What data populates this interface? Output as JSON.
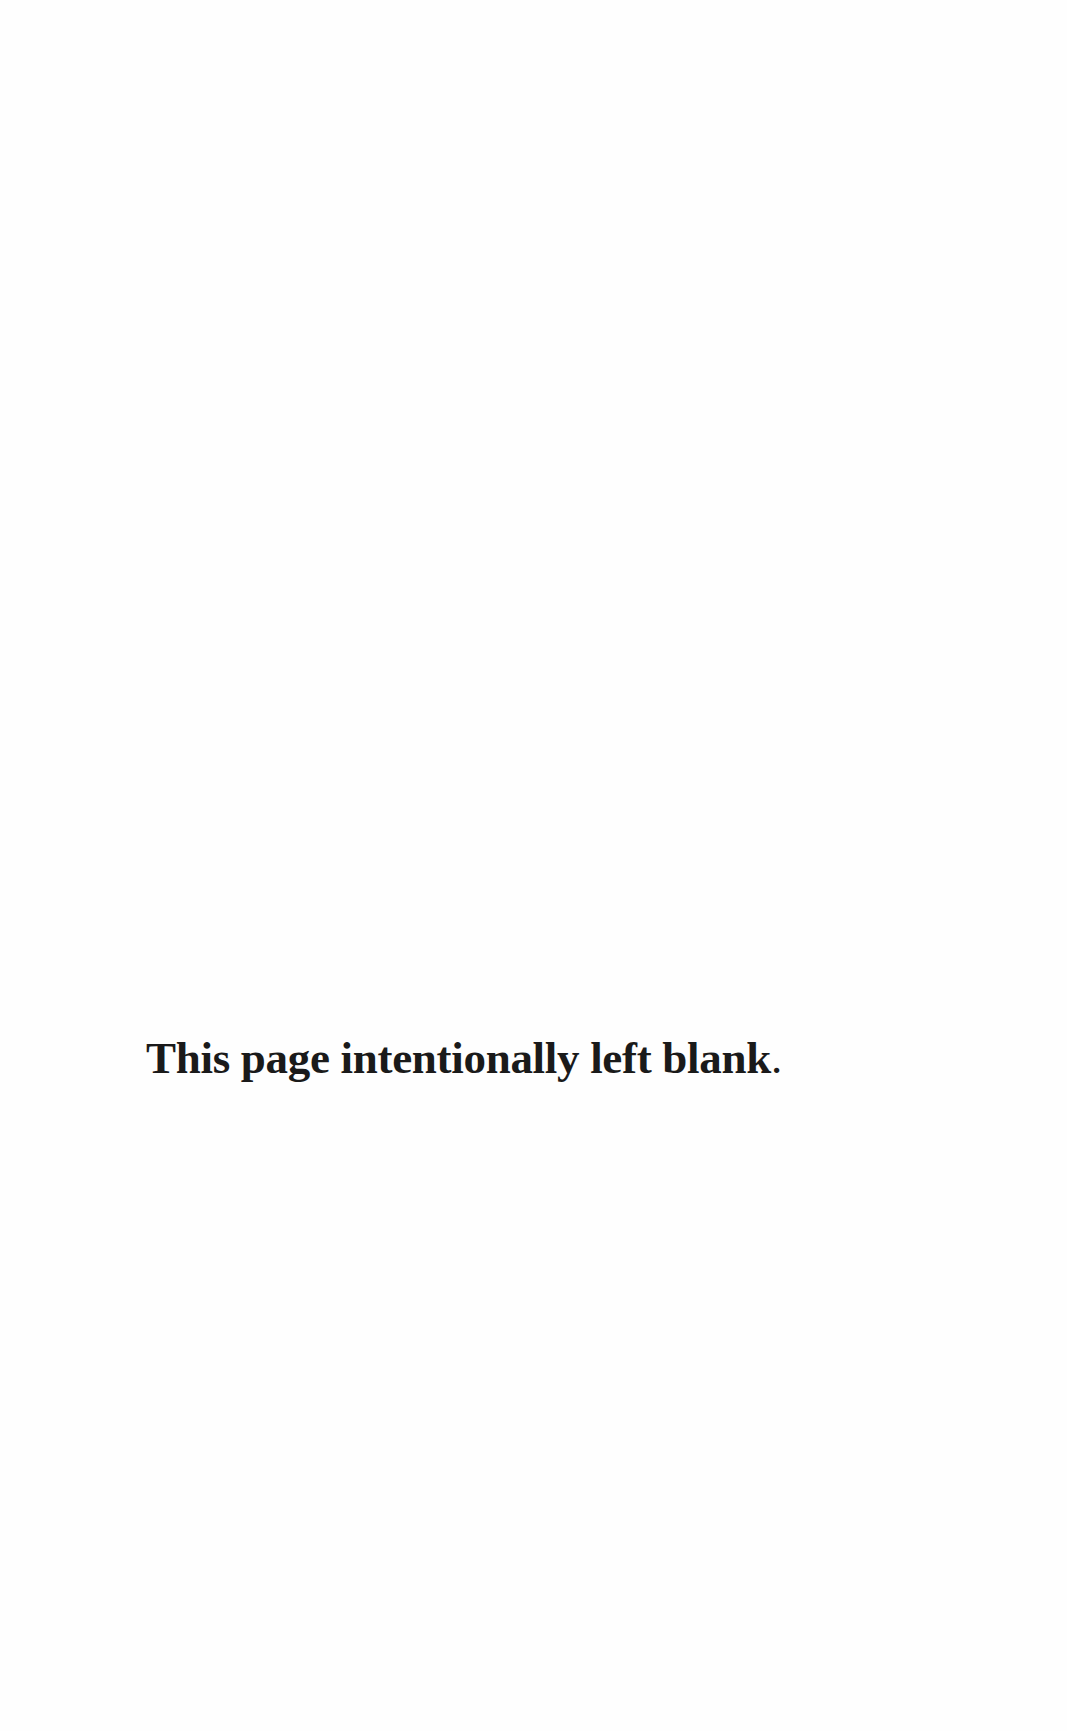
{
  "page": {
    "notice": {
      "text": "This page intentionally left blank",
      "punctuation": "."
    }
  },
  "colors": {
    "background": "#fefefe",
    "text": "#1a1a1a"
  }
}
